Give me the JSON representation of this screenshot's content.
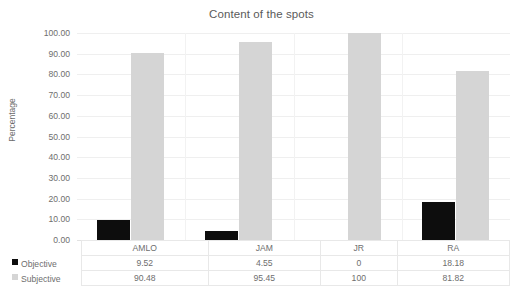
{
  "chart_data": {
    "type": "bar",
    "title": "Content of the spots",
    "xlabel": "",
    "ylabel": "Percentage",
    "ylim": [
      0,
      100
    ],
    "ytick_step": 10,
    "ytick_labels": [
      "0.00",
      "10.00",
      "20.00",
      "30.00",
      "40.00",
      "50.00",
      "60.00",
      "70.00",
      "80.00",
      "90.00",
      "100.00"
    ],
    "categories": [
      "AMLO",
      "JAM",
      "JR",
      "RA"
    ],
    "grid": true,
    "legend_position": "data-table",
    "series": [
      {
        "name": "Objective",
        "color": "#0d0d0d",
        "values": [
          9.52,
          4.55,
          0,
          18.18
        ],
        "labels": [
          "9.52",
          "4.55",
          "0",
          "18.18"
        ]
      },
      {
        "name": "Subjective",
        "color": "#d5d5d5",
        "values": [
          90.48,
          95.45,
          100,
          81.82
        ],
        "labels": [
          "90.48",
          "95.45",
          "100",
          "81.82"
        ]
      }
    ]
  },
  "legend": {
    "objective_marker": "square-swatch-icon",
    "subjective_marker": "square-swatch-icon"
  }
}
